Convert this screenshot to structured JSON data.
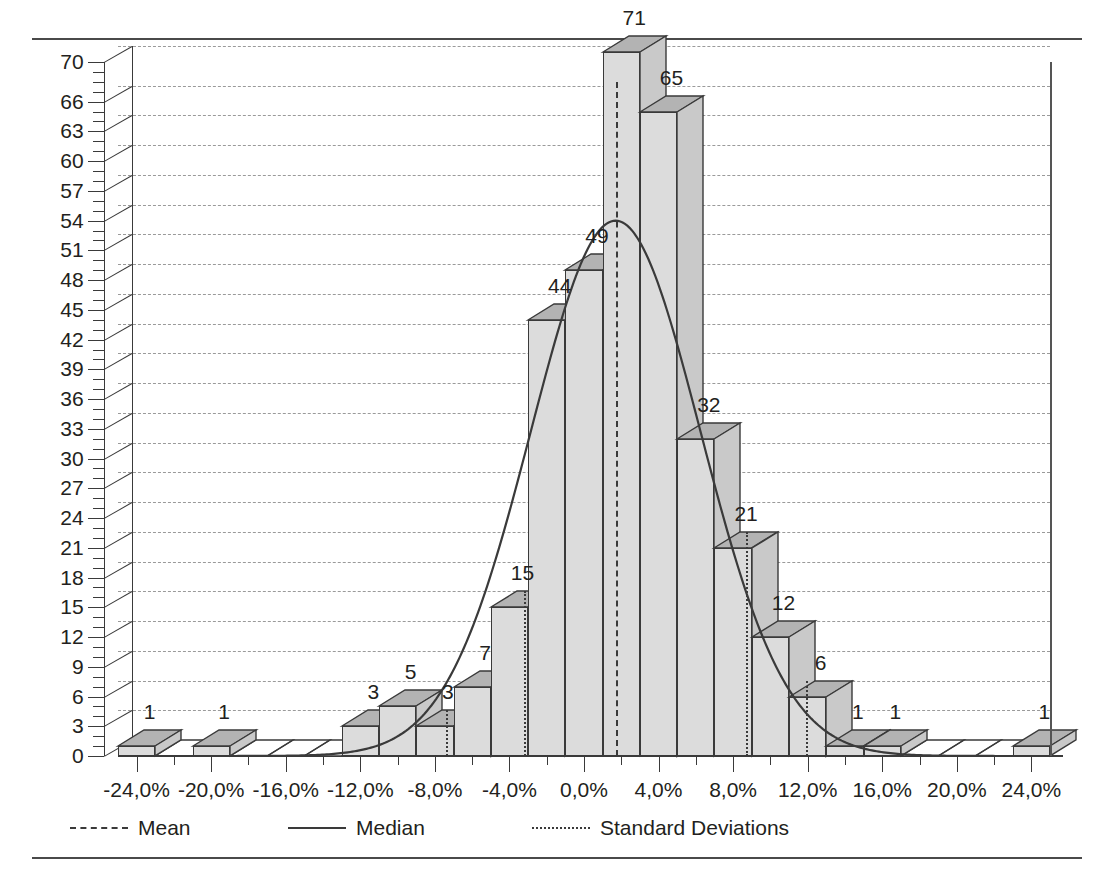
{
  "chart_data": {
    "type": "bar",
    "title": "",
    "subtitle": "",
    "xlabel": "",
    "ylabel": "",
    "grid": true,
    "legend_position": "bottom-left",
    "xlim": [
      -25,
      25
    ],
    "ylim": [
      0,
      70
    ],
    "y_tick_step": 3,
    "y_minor_tick_step": 1,
    "x_tick_step": 4,
    "x_minor_tick_step": 2,
    "bin_width": 2,
    "y_ticks": [
      0,
      3,
      6,
      9,
      12,
      15,
      18,
      21,
      24,
      27,
      30,
      33,
      36,
      39,
      42,
      45,
      48,
      51,
      54,
      57,
      60,
      63,
      66,
      70
    ],
    "y_tick_labels": [
      "0",
      "3",
      "6",
      "9",
      "12",
      "15",
      "18",
      "21",
      "24",
      "27",
      "30",
      "33",
      "36",
      "39",
      "42",
      "45",
      "48",
      "51",
      "54",
      "57",
      "60",
      "63",
      "66",
      "70"
    ],
    "x_ticks": [
      -24,
      -20,
      -16,
      -12,
      -8,
      -4,
      0,
      4,
      8,
      12,
      16,
      20,
      24
    ],
    "x_tick_labels": [
      "-24,0%",
      "-20,0%",
      "-16,0%",
      "-12,0%",
      "-8,0%",
      "-4,0%",
      "0,0%",
      "4,0%",
      "8,0%",
      "12,0%",
      "16,0%",
      "20,0%",
      "24,0%"
    ],
    "categories": [
      "-24,0%",
      "-22,0%",
      "-20,0%",
      "-18,0%",
      "-16,0%",
      "-14,0%",
      "-12,0%",
      "-10,0%",
      "-8,0%",
      "-6,0%",
      "-4,0%",
      "-2,0%",
      "0,0%",
      "2,0%",
      "4,0%",
      "6,0%",
      "8,0%",
      "10,0%",
      "12,0%",
      "14,0%",
      "16,0%",
      "18,0%",
      "20,0%",
      "22,0%",
      "24,0%"
    ],
    "bin_centers": [
      -24,
      -22,
      -20,
      -18,
      -16,
      -14,
      -12,
      -10,
      -8,
      -6,
      -4,
      -2,
      0,
      2,
      4,
      6,
      8,
      10,
      12,
      14,
      16,
      18,
      20,
      22,
      24
    ],
    "values": [
      1,
      0,
      1,
      0,
      0,
      0,
      3,
      5,
      3,
      7,
      15,
      44,
      49,
      71,
      65,
      32,
      21,
      12,
      6,
      1,
      1,
      0,
      0,
      0,
      1
    ],
    "bar_labels": [
      "1",
      "",
      "1",
      "",
      "",
      "",
      "3",
      "5",
      "3",
      "7",
      "15",
      "44",
      "49",
      "71",
      "65",
      "32",
      "21",
      "12",
      "6",
      "1",
      "1",
      "",
      "",
      "",
      "1"
    ],
    "series": [
      {
        "name": "Frequency",
        "values": [
          1,
          0,
          1,
          0,
          0,
          0,
          3,
          5,
          3,
          7,
          15,
          44,
          49,
          71,
          65,
          32,
          21,
          12,
          6,
          1,
          1,
          0,
          0,
          0,
          1
        ]
      }
    ],
    "overlays": [
      {
        "name": "Mean",
        "type": "vline",
        "style": "dashed",
        "x": 1.0
      },
      {
        "name": "Median",
        "type": "curve",
        "style": "solid",
        "peak_x": 1.0,
        "peak_y": 54
      },
      {
        "name": "Standard Deviations",
        "type": "vline",
        "style": "dotted",
        "x": [
          -8.1,
          -3.9,
          8.0,
          11.2
        ]
      }
    ],
    "annotations": []
  },
  "legend": {
    "items": [
      {
        "label": "Mean",
        "style": "dashed",
        "icon": "dashed-line-icon"
      },
      {
        "label": "Median",
        "style": "solid",
        "icon": "solid-line-icon"
      },
      {
        "label": "Standard Deviations",
        "style": "dotted",
        "icon": "dotted-line-icon"
      }
    ]
  },
  "colors": {
    "bar_front": "#dcdcdc",
    "bar_top": "#b3b3b3",
    "bar_side": "#c9c9c9",
    "outline": "#3a3a3a",
    "grid": "#9a9a9a",
    "text": "#231f20",
    "rule": "#4a4a4a"
  }
}
